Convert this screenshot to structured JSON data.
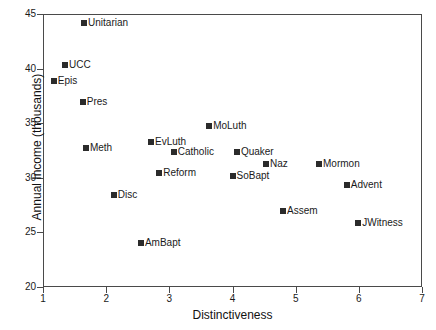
{
  "chart_data": {
    "type": "scatter",
    "title": "",
    "xlabel": "Distinctiveness",
    "ylabel": "Annual Income (thousands)",
    "xlim": [
      1,
      7
    ],
    "ylim": [
      20,
      45
    ],
    "xticks": [
      "1",
      "2",
      "3",
      "4",
      "5",
      "6",
      "7"
    ],
    "yticks": [
      "20",
      "25",
      "30",
      "35",
      "40",
      "45"
    ],
    "grid": false,
    "legend": "none",
    "marker_color": "#2b2b2b",
    "marker_shape": "square",
    "points": [
      {
        "label": "Unitarian",
        "x": 1.65,
        "y": 44.2
      },
      {
        "label": "UCC",
        "x": 1.35,
        "y": 40.3
      },
      {
        "label": "Epis",
        "x": 1.17,
        "y": 38.9
      },
      {
        "label": "Pres",
        "x": 1.63,
        "y": 36.9
      },
      {
        "label": "Meth",
        "x": 1.68,
        "y": 32.7
      },
      {
        "label": "EvLuth",
        "x": 2.71,
        "y": 33.3
      },
      {
        "label": "Catholic",
        "x": 3.07,
        "y": 32.4
      },
      {
        "label": "MoLuth",
        "x": 3.63,
        "y": 34.7
      },
      {
        "label": "Quaker",
        "x": 4.07,
        "y": 32.4
      },
      {
        "label": "Naz",
        "x": 4.53,
        "y": 31.3
      },
      {
        "label": "Mormon",
        "x": 5.37,
        "y": 31.3
      },
      {
        "label": "SoBapt",
        "x": 4.0,
        "y": 30.2
      },
      {
        "label": "Reform",
        "x": 2.84,
        "y": 30.4
      },
      {
        "label": "Advent",
        "x": 5.81,
        "y": 29.3
      },
      {
        "label": "Disc",
        "x": 2.12,
        "y": 28.4
      },
      {
        "label": "Assem",
        "x": 4.8,
        "y": 27.0
      },
      {
        "label": "JWitness",
        "x": 5.99,
        "y": 25.9
      },
      {
        "label": "AmBapt",
        "x": 2.55,
        "y": 24.0
      }
    ]
  }
}
